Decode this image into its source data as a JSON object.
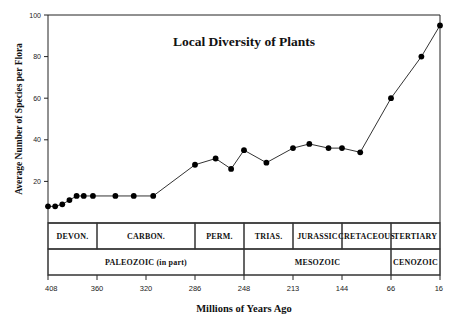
{
  "chart_data": {
    "type": "line",
    "title": "Local Diversity of Plants",
    "xlabel": "Millions of Years Ago",
    "ylabel": "Average Number of Species per Flora",
    "x_name": "Millions of Years Ago",
    "y_name": "Average Number of Species per Flora",
    "xlim": [
      408,
      16
    ],
    "ylim": [
      0,
      100
    ],
    "x_axis_reversed": true,
    "x_axis_scale": "geologic-nonlinear",
    "grid": false,
    "legend": null,
    "ytick_labels": [
      "20",
      "40",
      "60",
      "80",
      "100"
    ],
    "ytick_values": [
      20,
      40,
      60,
      80,
      100
    ],
    "xtick_labels": [
      "408",
      "360",
      "320",
      "286",
      "248",
      "213",
      "144",
      "66",
      "16"
    ],
    "xtick_values": [
      408,
      360,
      320,
      286,
      248,
      213,
      144,
      66,
      16
    ],
    "marker": "filled-circle",
    "series": [
      {
        "name": "Average Number of Species per Flora",
        "x": [
          408,
          401,
          394,
          387,
          380,
          373,
          364,
          358,
          345,
          330,
          315,
          297,
          286,
          270,
          258,
          248,
          232,
          213,
          190,
          163,
          144,
          115,
          66,
          35,
          16
        ],
        "values": [
          8,
          8,
          9,
          11,
          13,
          13,
          13,
          13,
          13,
          13,
          13,
          13,
          28,
          31,
          26,
          35,
          29,
          36,
          38,
          36,
          36,
          34,
          60,
          80,
          95
        ]
      }
    ],
    "points": [
      {
        "x": 408,
        "y": 8
      },
      {
        "x": 401,
        "y": 8
      },
      {
        "x": 394,
        "y": 9
      },
      {
        "x": 387,
        "y": 11
      },
      {
        "x": 380,
        "y": 13
      },
      {
        "x": 373,
        "y": 13
      },
      {
        "x": 364,
        "y": 13
      },
      {
        "x": 345,
        "y": 13
      },
      {
        "x": 330,
        "y": 13
      },
      {
        "x": 315,
        "y": 13
      },
      {
        "x": 286,
        "y": 28
      },
      {
        "x": 270,
        "y": 31
      },
      {
        "x": 258,
        "y": 26
      },
      {
        "x": 248,
        "y": 35
      },
      {
        "x": 232,
        "y": 29
      },
      {
        "x": 213,
        "y": 36
      },
      {
        "x": 190,
        "y": 38
      },
      {
        "x": 163,
        "y": 36
      },
      {
        "x": 144,
        "y": 36
      },
      {
        "x": 115,
        "y": 34
      },
      {
        "x": 66,
        "y": 60
      },
      {
        "x": 35,
        "y": 80
      },
      {
        "x": 16,
        "y": 95
      }
    ],
    "periods": [
      {
        "label": "DEVON.",
        "start": 408,
        "end": 360
      },
      {
        "label": "CARBON.",
        "start": 360,
        "end": 286
      },
      {
        "label": "PERM.",
        "start": 286,
        "end": 248
      },
      {
        "label": "TRIAS.",
        "start": 248,
        "end": 213
      },
      {
        "label": "JURASSIC",
        "start": 213,
        "end": 144
      },
      {
        "label": "CRETACEOUS",
        "start": 144,
        "end": 66
      },
      {
        "label": "TERTIARY",
        "start": 66,
        "end": 16
      }
    ],
    "eras": [
      {
        "label": "PALEOZOIC (in part)",
        "start": 408,
        "end": 248
      },
      {
        "label": "MESOZOIC",
        "start": 248,
        "end": 66
      },
      {
        "label": "CENOZOIC",
        "start": 66,
        "end": 16
      }
    ]
  },
  "colors": {
    "line": "#333333",
    "marker": "#000000",
    "axis": "#222222",
    "table_border": "#333333",
    "background": "#ffffff",
    "text": "#111111"
  }
}
